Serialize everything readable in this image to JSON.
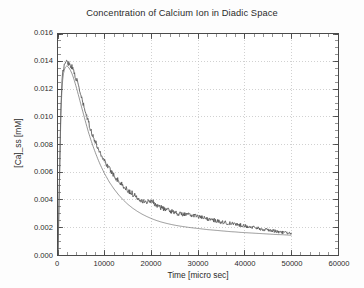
{
  "chart_data": {
    "type": "line",
    "title": "Concentration of Calcium Ion in Diadic Space",
    "xlabel": "Time [micro sec]",
    "ylabel": "[Ca]_ss [mM]",
    "xlim": [
      0,
      60000
    ],
    "ylim": [
      0.0,
      0.016
    ],
    "xticks": [
      0,
      10000,
      20000,
      30000,
      40000,
      50000,
      60000
    ],
    "xtick_labels": [
      "0",
      "10000",
      "20000",
      "30000",
      "40000",
      "50000",
      "60000"
    ],
    "yticks": [
      0.0,
      0.002,
      0.004,
      0.006,
      0.008,
      0.01,
      0.012,
      0.014,
      0.016
    ],
    "ytick_labels": [
      "0.000",
      "0.002",
      "0.004",
      "0.006",
      "0.008",
      "0.010",
      "0.012",
      "0.014",
      "0.016"
    ],
    "grid": true,
    "grid_style": "dotted",
    "grid_color": "#bdbdbd",
    "frame_color": "#4a4a4a",
    "legend": null,
    "series": [
      {
        "name": "stochastic",
        "color": "#555555",
        "style": "noisy-line",
        "x": [
          0,
          300,
          600,
          900,
          1200,
          1500,
          1800,
          2100,
          2400,
          2700,
          3000,
          3300,
          3600,
          4000,
          4500,
          5000,
          5500,
          6000,
          6500,
          7000,
          7500,
          8000,
          8500,
          9000,
          9500,
          10000,
          11000,
          12000,
          13000,
          14000,
          15000,
          16000,
          17000,
          18000,
          19000,
          20000,
          21000,
          22000,
          23000,
          24000,
          25000,
          26000,
          27000,
          28000,
          29000,
          30000,
          31000,
          32000,
          33000,
          34000,
          35000,
          36000,
          37000,
          38000,
          39000,
          40000,
          41000,
          42000,
          43000,
          44000,
          45000,
          46000,
          47000,
          48000,
          49000,
          50000
        ],
        "y": [
          0.0,
          0.0052,
          0.0105,
          0.0128,
          0.0136,
          0.0139,
          0.014,
          0.01395,
          0.01385,
          0.01375,
          0.0136,
          0.0134,
          0.0131,
          0.01265,
          0.0121,
          0.0114,
          0.0108,
          0.0102,
          0.00965,
          0.0091,
          0.0086,
          0.0082,
          0.0078,
          0.00745,
          0.0071,
          0.00681,
          0.00625,
          0.00578,
          0.00535,
          0.00498,
          0.00468,
          0.00442,
          0.00418,
          0.00398,
          0.0038,
          0.00398,
          0.00362,
          0.00345,
          0.00332,
          0.0032,
          0.0031,
          0.00298,
          0.00295,
          0.0029,
          0.00288,
          0.0028,
          0.00268,
          0.00262,
          0.00255,
          0.00248,
          0.0024,
          0.00232,
          0.00228,
          0.00222,
          0.00218,
          0.00212,
          0.00205,
          0.00198,
          0.00192,
          0.00185,
          0.0018,
          0.00175,
          0.0017,
          0.00165,
          0.0016,
          0.00152
        ],
        "noise_amplitude": 0.00012
      },
      {
        "name": "deterministic",
        "color": "#6a6a6a",
        "style": "smooth-line",
        "x": [
          0,
          300,
          600,
          900,
          1200,
          1500,
          1800,
          2100,
          2400,
          2700,
          3000,
          3300,
          3600,
          4000,
          4500,
          5000,
          5500,
          6000,
          6500,
          7000,
          7500,
          8000,
          8500,
          9000,
          9500,
          10000,
          11000,
          12000,
          13000,
          14000,
          15000,
          16000,
          17000,
          18000,
          19000,
          20000,
          21000,
          22000,
          23000,
          24000,
          25000,
          26000,
          27000,
          28000,
          29000,
          30000,
          31000,
          32000,
          33000,
          34000,
          35000,
          36000,
          37000,
          38000,
          39000,
          40000,
          41000,
          42000,
          43000,
          44000,
          45000,
          46000,
          47000,
          48000,
          49000,
          50000
        ],
        "y": [
          0.0,
          0.005,
          0.0101,
          0.0124,
          0.0132,
          0.01355,
          0.01368,
          0.01365,
          0.01352,
          0.01335,
          0.01312,
          0.01285,
          0.01252,
          0.01205,
          0.01142,
          0.01078,
          0.01015,
          0.00952,
          0.00892,
          0.00838,
          0.00788,
          0.00742,
          0.00698,
          0.00658,
          0.00622,
          0.00588,
          0.00528,
          0.00478,
          0.00435,
          0.00398,
          0.00366,
          0.00339,
          0.00316,
          0.00296,
          0.00279,
          0.00264,
          0.00251,
          0.0024,
          0.00231,
          0.00223,
          0.00216,
          0.0021,
          0.00205,
          0.002,
          0.00196,
          0.00192,
          0.00188,
          0.00184,
          0.00181,
          0.00178,
          0.00175,
          0.00172,
          0.00169,
          0.00167,
          0.00164,
          0.00162,
          0.0016,
          0.00158,
          0.00156,
          0.00154,
          0.00152,
          0.0015,
          0.00148,
          0.00147,
          0.00145,
          0.00143
        ]
      }
    ]
  }
}
